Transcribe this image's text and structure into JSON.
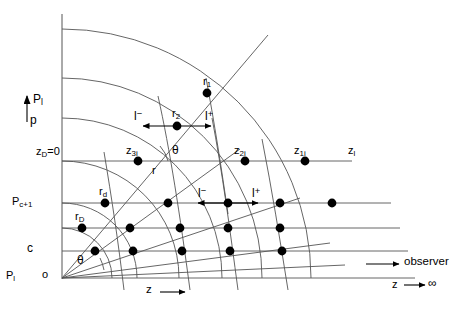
{
  "figure": {
    "axes": {
      "vertical_axis_label": "P",
      "vertical_axis_sub": "l",
      "vertical_axis_secondary": "p",
      "horizontal_axis_label": "z",
      "horizontal_axis_arrow": "⟶",
      "origin_label": "o"
    },
    "level_labels": [
      {
        "name": "z-d-zero",
        "text": "z",
        "sub": "D",
        "suffix": "=0"
      },
      {
        "name": "p-c-plus-1",
        "text": "P",
        "sub": "c+1",
        "suffix": ""
      },
      {
        "name": "level-c",
        "text": "c",
        "sub": "",
        "suffix": ""
      },
      {
        "name": "p-one",
        "text": "P",
        "sub": "l",
        "suffix": ""
      }
    ],
    "point_labels": [
      {
        "name": "r-1",
        "text": "r",
        "sub": "1"
      },
      {
        "name": "r-2",
        "text": "r",
        "sub": "2"
      },
      {
        "name": "r-d",
        "text": "r",
        "sub": "d"
      },
      {
        "name": "r-D",
        "text": "r",
        "sub": "D"
      },
      {
        "name": "z-3i",
        "text": "z",
        "sub": "3i"
      },
      {
        "name": "z-2i",
        "text": "z",
        "sub": "2i"
      },
      {
        "name": "z-1i",
        "text": "z",
        "sub": "1i"
      },
      {
        "name": "z-l",
        "text": "z",
        "sub": "l"
      }
    ],
    "radial_label": "r",
    "angle_label": "θ",
    "direction_labels": [
      {
        "name": "l-minus-upper",
        "text": "l",
        "sup": "−"
      },
      {
        "name": "l-plus-upper",
        "text": "l",
        "sup": "+"
      },
      {
        "name": "l-minus-lower",
        "text": "l",
        "sup": "−"
      },
      {
        "name": "l-plus-lower",
        "text": "l",
        "sup": "+"
      }
    ],
    "observer": {
      "label": "observer",
      "limit_var": "z",
      "limit_arrow": "─➤",
      "limit_value": "∞"
    },
    "colors": {
      "line": "#555555",
      "node": "#000000",
      "text": "#000000",
      "background": "#ffffff"
    }
  }
}
